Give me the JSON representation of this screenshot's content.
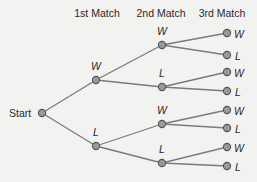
{
  "headers": [
    "1st Match",
    "2nd Match",
    "3rd Match"
  ],
  "root": {
    "label": "Start"
  },
  "level1": [
    {
      "label": "W"
    },
    {
      "label": "L"
    }
  ],
  "level2": [
    {
      "label": "W"
    },
    {
      "label": "L"
    },
    {
      "label": "W"
    },
    {
      "label": "L"
    }
  ],
  "level3": [
    {
      "label": "W"
    },
    {
      "label": "L"
    },
    {
      "label": "W"
    },
    {
      "label": "L"
    },
    {
      "label": "W"
    },
    {
      "label": "L"
    },
    {
      "label": "W"
    },
    {
      "label": "L"
    }
  ],
  "colors": {
    "background": "#f2f2f1",
    "edge": "#7a7a7a",
    "node_fill": "#9a9a9a",
    "node_stroke": "#555555"
  }
}
